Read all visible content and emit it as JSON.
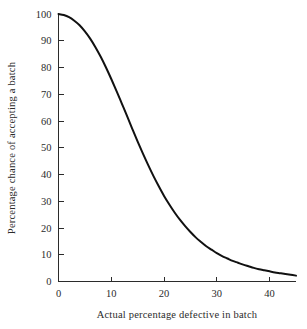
{
  "chart_data": {
    "type": "line",
    "title": "",
    "subtitle": "",
    "xlabel": "Actual percentage defective in batch",
    "ylabel": "Percentage chance of accepting a batch",
    "xlim": [
      0,
      45
    ],
    "ylim": [
      0,
      100
    ],
    "grid": false,
    "legend": null,
    "legend_position": "none",
    "xticks": [
      0,
      10,
      20,
      30,
      40
    ],
    "xtick_labels": [
      "0",
      "10",
      "20",
      "30",
      "40"
    ],
    "yticks": [
      0,
      10,
      20,
      30,
      40,
      50,
      60,
      70,
      80,
      90,
      100
    ],
    "ytick_labels": [
      "0",
      "10",
      "20",
      "30",
      "40",
      "50",
      "60",
      "70",
      "80",
      "90",
      "100"
    ],
    "series": [
      {
        "name": "Operating characteristic curve",
        "color": "#111111",
        "x": [
          0,
          1,
          2,
          3,
          4,
          5,
          6,
          7,
          8,
          9,
          10,
          11,
          12,
          13,
          14,
          15,
          16,
          17,
          18,
          19,
          20,
          21,
          22,
          23,
          24,
          25,
          26,
          27,
          28,
          29,
          30,
          31,
          32,
          33,
          34,
          35,
          36,
          37,
          38,
          39,
          40,
          41,
          42,
          43,
          44,
          45
        ],
        "y": [
          100,
          99.6,
          98.8,
          97.5,
          95.8,
          93.5,
          90.8,
          87.6,
          84.0,
          80.0,
          75.7,
          71.2,
          66.5,
          61.8,
          57.0,
          52.3,
          47.8,
          43.5,
          39.4,
          35.6,
          32.0,
          28.8,
          25.8,
          23.1,
          20.7,
          18.5,
          16.5,
          14.8,
          13.2,
          11.9,
          10.6,
          9.5,
          8.6,
          7.7,
          7.0,
          6.3,
          5.7,
          5.1,
          4.6,
          4.2,
          3.8,
          3.4,
          3.1,
          2.8,
          2.5,
          2.2
        ]
      }
    ]
  },
  "axes": {
    "y_axis_title": "Percentage chance of accepting a batch",
    "x_axis_title": "Actual percentage defective in batch"
  },
  "colors": {
    "curve": "#111111",
    "axis": "#2b2b2b",
    "background": "#ffffff"
  }
}
